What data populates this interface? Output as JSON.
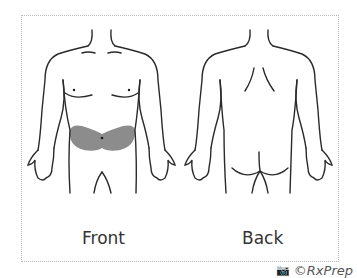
{
  "figure": {
    "labels": {
      "front": "Front",
      "back": "Back"
    },
    "highlight": {
      "region": "lower abdomen",
      "color": "#8c8c8c"
    },
    "credit": {
      "icon": "camera-icon",
      "text": "©RxPrep"
    },
    "colors": {
      "outline": "#2a2a2a",
      "frame_border": "#b8b8b8"
    }
  }
}
